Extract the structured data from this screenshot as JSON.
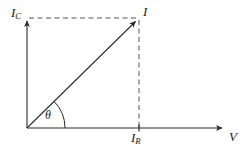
{
  "figure": {
    "type": "phasor-diagram",
    "title": "",
    "background_color": "#ffffff",
    "line_color": "#2b2b2b",
    "dash_color": "#555555",
    "text_color": "#1a1a1a",
    "width": 247,
    "height": 148
  },
  "axes": {
    "origin": {
      "x": 27,
      "y": 128
    },
    "vertical": {
      "label_main": "I",
      "label_sub": "C",
      "from": {
        "x": 27,
        "y": 128
      },
      "to": {
        "x": 27,
        "y": 18
      },
      "arrow": true
    },
    "horizontal": {
      "label_main": "V",
      "label_sub": "",
      "from": {
        "x": 27,
        "y": 128
      },
      "to": {
        "x": 225,
        "y": 128
      },
      "arrow": true
    }
  },
  "vectors": [
    {
      "name": "resultant-current",
      "label_main": "I",
      "label_sub": "",
      "from": {
        "x": 27,
        "y": 128
      },
      "to": {
        "x": 139,
        "y": 18
      },
      "arrow": true
    }
  ],
  "components": [
    {
      "name": "resistive-current",
      "label_main": "I",
      "label_sub": "R",
      "axis": "horizontal",
      "tick": {
        "x": 139,
        "y": 128
      }
    },
    {
      "name": "capacitive-current",
      "label_main": "I",
      "label_sub": "C",
      "axis": "vertical",
      "tick": {
        "x": 27,
        "y": 18
      }
    }
  ],
  "projection_lines": [
    {
      "name": "horizontal-projection",
      "style": "dashed",
      "from": {
        "x": 29,
        "y": 18
      },
      "to": {
        "x": 139,
        "y": 18
      }
    },
    {
      "name": "vertical-projection",
      "style": "dashed",
      "from": {
        "x": 139,
        "y": 18
      },
      "to": {
        "x": 139,
        "y": 127
      }
    }
  ],
  "angle": {
    "label": "θ",
    "name": "phase-angle",
    "vertex": {
      "x": 27,
      "y": 128
    },
    "radius": 38,
    "start_deg": 0,
    "end_deg": 44.5
  },
  "labels": {
    "ic": {
      "main": "I",
      "sub": "C"
    },
    "i": {
      "main": "I",
      "sub": ""
    },
    "ir": {
      "main": "I",
      "sub": "R"
    },
    "v": {
      "main": "V",
      "sub": ""
    },
    "theta": "θ"
  }
}
